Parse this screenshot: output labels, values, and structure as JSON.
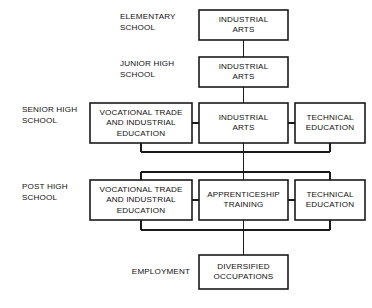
{
  "diagram": {
    "colors": {
      "background": "#ffffff",
      "box_fill": "#ffffff",
      "box_stroke": "#1a1a1a",
      "connector": "#1a1a1a",
      "text": "#111111"
    },
    "stage_labels": [
      {
        "id": "elementary-school",
        "lines": [
          "ELEMENTARY",
          "SCHOOL"
        ],
        "x": 120,
        "y": 17,
        "align": "left"
      },
      {
        "id": "junior-high-school",
        "lines": [
          "JUNIOR HIGH",
          "SCHOOL"
        ],
        "x": 120,
        "y": 64,
        "align": "left"
      },
      {
        "id": "senior-high-school",
        "lines": [
          "SENIOR HIGH",
          "SCHOOL"
        ],
        "x": 22,
        "y": 110,
        "align": "left"
      },
      {
        "id": "post-high-school",
        "lines": [
          "POST HIGH",
          "SCHOOL"
        ],
        "x": 22,
        "y": 187,
        "align": "left"
      },
      {
        "id": "employment",
        "lines": [
          "EMPLOYMENT"
        ],
        "x": 190,
        "y": 272,
        "align": "right"
      }
    ],
    "boxes": [
      {
        "id": "elementary-industrial-arts",
        "lines": [
          "INDUSTRIAL",
          "ARTS"
        ],
        "x": 199,
        "y": 10,
        "w": 89,
        "h": 30
      },
      {
        "id": "junior-high-industrial-arts",
        "lines": [
          "INDUSTRIAL",
          "ARTS"
        ],
        "x": 199,
        "y": 57,
        "w": 89,
        "h": 30
      },
      {
        "id": "senior-high-vocational-trade",
        "lines": [
          "VOCATIONAL TRADE",
          "AND INDUSTRIAL",
          "EDUCATION"
        ],
        "x": 90,
        "y": 103,
        "w": 102,
        "h": 40
      },
      {
        "id": "senior-high-industrial-arts",
        "lines": [
          "INDUSTRIAL",
          "ARTS"
        ],
        "x": 199,
        "y": 103,
        "w": 89,
        "h": 40
      },
      {
        "id": "senior-high-technical-education",
        "lines": [
          "TECHNICAL",
          "EDUCATION"
        ],
        "x": 295,
        "y": 103,
        "w": 70,
        "h": 40
      },
      {
        "id": "post-high-vocational-trade",
        "lines": [
          "VOCATIONAL TRADE",
          "AND INDUSTRIAL",
          "EDUCATION"
        ],
        "x": 90,
        "y": 180,
        "w": 102,
        "h": 40
      },
      {
        "id": "post-high-apprenticeship-training",
        "lines": [
          "APPRENTICESHIP",
          "TRAINING"
        ],
        "x": 199,
        "y": 180,
        "w": 89,
        "h": 40
      },
      {
        "id": "post-high-technical-education",
        "lines": [
          "TECHNICAL",
          "EDUCATION"
        ],
        "x": 295,
        "y": 180,
        "w": 70,
        "h": 40
      },
      {
        "id": "employment-diversified-occupations",
        "lines": [
          "DIVERSIFIED",
          "OCCUPATIONS"
        ],
        "x": 199,
        "y": 255,
        "w": 89,
        "h": 34
      }
    ],
    "connectors": [
      {
        "id": "elementary-to-junior-high",
        "points": "243.5,40 243.5,57"
      },
      {
        "id": "junior-high-to-senior-high",
        "points": "243.5,87 243.5,103"
      },
      {
        "id": "senior-high-left-to-center",
        "points": "192,123 199,123"
      },
      {
        "id": "senior-high-center-to-right",
        "points": "288,123 295,123"
      },
      {
        "id": "senior-high-left-drop",
        "points": "141,143 141,152"
      },
      {
        "id": "senior-high-right-drop",
        "points": "330,143 330,152"
      },
      {
        "id": "senior-high-bus-upper",
        "points": "141,152 330,152"
      },
      {
        "id": "senior-high-center-through",
        "points": "243.5,143 243.5,180"
      },
      {
        "id": "post-high-bus-lower",
        "points": "141,172 330,172"
      },
      {
        "id": "post-high-left-rise",
        "points": "141,172 141,180"
      },
      {
        "id": "post-high-right-rise",
        "points": "330,172 330,180"
      },
      {
        "id": "post-high-left-to-center",
        "points": "192,200 199,200"
      },
      {
        "id": "post-high-center-to-right",
        "points": "288,200 295,200"
      },
      {
        "id": "post-high-left-drop",
        "points": "141,220 141,230"
      },
      {
        "id": "post-high-right-drop",
        "points": "330,220 330,230"
      },
      {
        "id": "employment-bus",
        "points": "141,230 330,230"
      },
      {
        "id": "post-high-center-to-employment",
        "points": "243.5,220 243.5,255"
      }
    ]
  }
}
